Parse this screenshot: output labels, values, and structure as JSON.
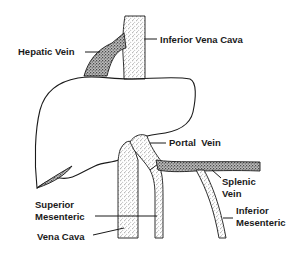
{
  "diagram": {
    "labels": {
      "hepatic_vein": "Hepatic Vein",
      "inferior_vena_cava": "Inferior Vena Cava",
      "portal_vein": "Portal  Vein",
      "splenic_vein_line1": "Splenic",
      "splenic_vein_line2": "Vein",
      "superior_mesenteric_line1": "Superior",
      "superior_mesenteric_line2": "Mesenteric",
      "inferior_mesenteric_line1": "Inferior",
      "inferior_mesenteric_line2": "Mesenteric",
      "vena_cava": "Vena Cava"
    },
    "structures": [
      "liver-outline",
      "inferior-vena-cava",
      "hepatic-vein",
      "portal-vein",
      "splenic-vein",
      "superior-mesenteric-vein",
      "inferior-mesenteric-vein",
      "vena-cava-lower"
    ],
    "colors": {
      "background": "#ffffff",
      "ink": "#1a1a1a"
    }
  }
}
